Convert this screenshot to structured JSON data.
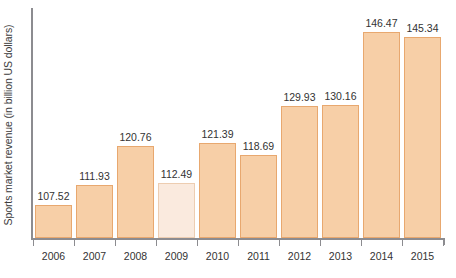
{
  "chart_data": {
    "type": "bar",
    "title": "",
    "subtitle": "",
    "xlabel": "",
    "ylabel": "Sports market revenue (in billion US dollars)",
    "categories": [
      "2006",
      "2007",
      "2008",
      "2009",
      "2010",
      "2011",
      "2012",
      "2013",
      "2014",
      "2015"
    ],
    "values": [
      107.52,
      111.93,
      120.76,
      112.49,
      121.39,
      118.69,
      129.93,
      130.16,
      146.47,
      145.34
    ],
    "value_labels": [
      "107.52",
      "111.93",
      "120.76",
      "112.49",
      "121.39",
      "118.69",
      "129.93",
      "130.16",
      "146.47",
      "145.34"
    ],
    "series": [
      {
        "name": "Sports market revenue",
        "values": [
          107.52,
          111.93,
          120.76,
          112.49,
          121.39,
          118.69,
          129.93,
          130.16,
          146.47,
          145.34
        ]
      }
    ],
    "highlighted_categories": [
      "2009"
    ],
    "ylim": [
      100,
      152
    ],
    "grid": false,
    "legend": false,
    "legend_position": "none",
    "y_tick_labels": [],
    "annotations": []
  },
  "colors": {
    "bar_fill": "#f7cfa7",
    "bar_border": "#e8a86f",
    "bar_fill_highlight": "#faeade",
    "bar_border_highlight": "#edcdb1",
    "axis": "#8c8c90",
    "text": "#333333",
    "background": "#ffffff"
  }
}
